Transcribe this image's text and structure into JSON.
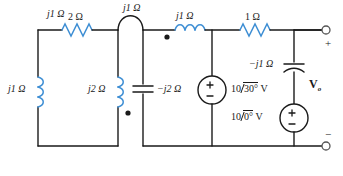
{
  "figure": {
    "type": "ac-circuit-schematic",
    "wire_color": "#1a1a1a",
    "component_color": "#3f8fd4",
    "background": "#ffffff"
  },
  "components": {
    "r_2ohm": {
      "label": "2 Ω",
      "kind": "resistor",
      "value": "2",
      "unit": "Ω"
    },
    "r_1ohm": {
      "label": "1 Ω",
      "kind": "resistor",
      "value": "1",
      "unit": "Ω"
    },
    "l_left": {
      "label": "j1 Ω",
      "kind": "inductor",
      "value": "j1",
      "unit": "Ω"
    },
    "l_mid": {
      "label": "j2 Ω",
      "kind": "inductor",
      "value": "j2",
      "unit": "Ω"
    },
    "l_right": {
      "label": "j1 Ω",
      "kind": "inductor",
      "value": "j1",
      "unit": "Ω"
    },
    "mutual": {
      "label": "j1 Ω",
      "kind": "mutual-coupling",
      "value": "j1",
      "unit": "Ω"
    },
    "c_mid": {
      "label": "−j2 Ω",
      "kind": "capacitor",
      "value": "-j2",
      "unit": "Ω"
    },
    "c_right": {
      "label": "−j1 Ω",
      "kind": "capacitor",
      "value": "-j1",
      "unit": "Ω"
    }
  },
  "sources": {
    "v1": {
      "magnitude": "10",
      "angle": "30°",
      "unit": "V",
      "label": "10/30° V",
      "polarity_top": "+",
      "polarity_bottom": "−"
    },
    "v2": {
      "magnitude": "10",
      "angle": "0°",
      "unit": "V",
      "label": "10/0° V",
      "polarity_top": "+",
      "polarity_bottom": "−"
    }
  },
  "output": {
    "symbol": "V",
    "subscript": "o",
    "label": "Vo",
    "terminal_plus": "+",
    "terminal_minus": "−"
  },
  "dots": {
    "mid_inductor_dot": "polarity-dot",
    "right_inductor_dot": "polarity-dot"
  }
}
